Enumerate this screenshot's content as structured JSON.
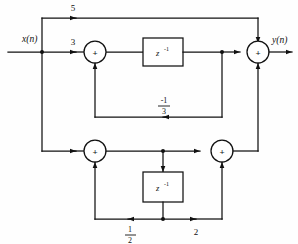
{
  "diagram": {
    "type": "signal-flow-graph",
    "input_label": "x(n)",
    "output_label": "y(n)",
    "colors": {
      "line": "#111111",
      "background": "#ffffff",
      "fill": "#ffffff"
    },
    "gains": {
      "feedforward_top": "5",
      "input_path": "3",
      "feedback_third_num": "-1",
      "feedback_third_den": "3",
      "lower_half_num": "1",
      "lower_half_den": "2",
      "lower_two": "2"
    },
    "blocks": {
      "delay_top": "z",
      "delay_top_exp": "-1",
      "delay_bottom": "z",
      "delay_bottom_exp": "-1"
    },
    "summers": {
      "top_left": "+",
      "top_right": "+",
      "bottom_left": "+",
      "bottom_right": "+"
    }
  }
}
